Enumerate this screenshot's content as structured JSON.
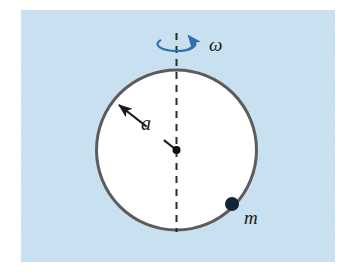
{
  "figure": {
    "kind": "physics-diagram",
    "panel": {
      "background_color": "#c9e2f2",
      "page_color": "#ffffff",
      "x": 21,
      "y": 10,
      "width": 314,
      "height": 252
    },
    "hoop": {
      "name": "hoop",
      "center_x": 176.5,
      "center_y": 150,
      "radius": 80,
      "fill_color": "#ffffff",
      "stroke_color": "#5c5c5c",
      "stroke_width": 3
    },
    "rotation_axis": {
      "name": "rotation-axis",
      "x": 176.5,
      "y_top": 33,
      "y_bottom": 232,
      "stroke_color": "#2b2b2b",
      "stroke_width": 2,
      "dash_pattern": "7 6"
    },
    "rotation_arrow": {
      "name": "rotation-arrow",
      "color": "#2f6fb0",
      "center_x": 176.5,
      "center_y": 44,
      "rx": 19,
      "ry": 7
    },
    "omega_label": {
      "text": "ω",
      "x": 209,
      "y": 51,
      "color": "#1b3c63",
      "font_size": 19
    },
    "radius_arrow": {
      "name": "radius-arrow",
      "from_x": 176.5,
      "from_y": 150,
      "to_x": 119,
      "to_y": 105,
      "color": "#1a1a1a",
      "stroke_width": 2
    },
    "radius_label": {
      "text": "a",
      "x": 141,
      "y": 130,
      "font_size": 20
    },
    "center_point": {
      "name": "center-point",
      "x": 176.5,
      "y": 150,
      "radius": 4,
      "color": "#111111"
    },
    "mass_point": {
      "name": "mass-point",
      "x": 232,
      "y": 204,
      "radius": 7,
      "color": "#10243a"
    },
    "mass_label": {
      "text": "m",
      "x": 244,
      "y": 224,
      "font_size": 19
    }
  }
}
